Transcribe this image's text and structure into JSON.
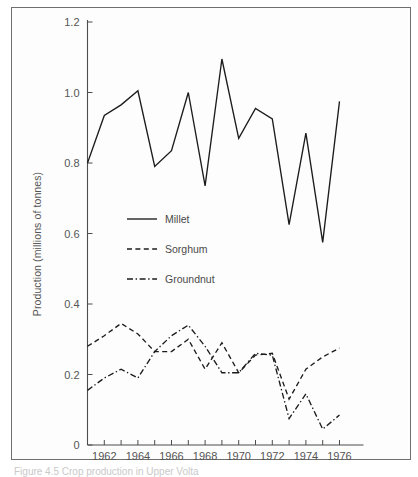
{
  "figure": {
    "caption": "Figure 4.5   Crop production in Upper Volta"
  },
  "chart_data": {
    "type": "line",
    "title": "",
    "xlabel": "",
    "ylabel": "Production (millions of tonnes)",
    "x": [
      1961,
      1962,
      1963,
      1964,
      1965,
      1966,
      1967,
      1968,
      1969,
      1970,
      1971,
      1972,
      1973,
      1974,
      1975,
      1976
    ],
    "xlim": [
      1961,
      1976
    ],
    "ylim": [
      0,
      1.2
    ],
    "yticks": [
      0,
      0.2,
      0.4,
      0.6,
      0.8,
      1.0,
      1.2
    ],
    "ytick_labels": [
      "0",
      "0.2",
      "0.4",
      "0.6",
      "0.8",
      "1.0",
      "1.2"
    ],
    "xticks": [
      1961,
      1962,
      1963,
      1964,
      1965,
      1966,
      1967,
      1968,
      1969,
      1970,
      1971,
      1972,
      1973,
      1974,
      1975,
      1976
    ],
    "xtick_labels": [
      "",
      "1962",
      "",
      "1964",
      "",
      "1966",
      "",
      "1968",
      "",
      "1970",
      "",
      "1972",
      "",
      "1974",
      "",
      "1976"
    ],
    "grid": false,
    "legend_position": "center-left",
    "series": [
      {
        "name": "Millet",
        "style": "solid",
        "values": [
          0.8,
          0.935,
          0.965,
          1.005,
          0.79,
          0.835,
          1.0,
          0.735,
          1.095,
          0.87,
          0.955,
          0.925,
          0.625,
          0.885,
          0.575,
          0.975
        ]
      },
      {
        "name": "Sorghum",
        "style": "dashed",
        "values": [
          0.28,
          0.31,
          0.345,
          0.315,
          0.265,
          0.265,
          0.3,
          0.215,
          0.29,
          0.205,
          0.255,
          0.26,
          0.13,
          0.215,
          0.25,
          0.275
        ]
      },
      {
        "name": "Groundnut",
        "style": "dash-dot",
        "values": [
          0.155,
          0.19,
          0.215,
          0.19,
          0.265,
          0.31,
          0.34,
          0.28,
          0.205,
          0.205,
          0.26,
          0.255,
          0.075,
          0.145,
          0.045,
          0.085
        ]
      }
    ]
  },
  "legend": {
    "items": [
      {
        "label": "Millet",
        "style": "solid"
      },
      {
        "label": "Sorghum",
        "style": "dashed"
      },
      {
        "label": "Groundnut",
        "style": "dash-dot"
      }
    ]
  },
  "colors": {
    "ink": "#1c1c1c",
    "axis": "#4d4d4d",
    "tick_text": "#555555",
    "frame": "#6f6f6f",
    "background": "#ffffff"
  }
}
